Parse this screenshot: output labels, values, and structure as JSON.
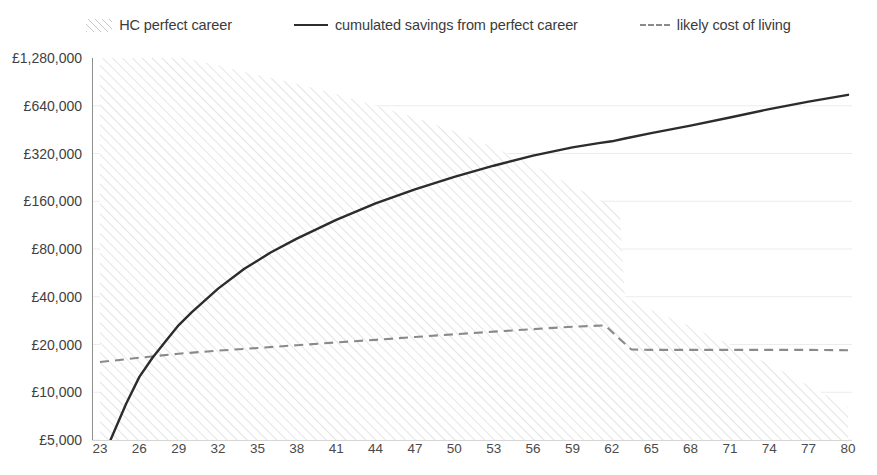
{
  "legend": {
    "items": [
      {
        "label": "HC perfect career",
        "marker": "hatch-swatch-icon"
      },
      {
        "label": "cumulated savings from perfect career",
        "marker": "solid-line-icon"
      },
      {
        "label": "likely cost of living",
        "marker": "dashed-line-icon"
      }
    ]
  },
  "chart_data": {
    "type": "line",
    "title": "",
    "xlabel": "",
    "ylabel": "",
    "yscale": "log2",
    "ylim": [
      5000,
      1280000
    ],
    "xlim": [
      23,
      80
    ],
    "grid": true,
    "legend_position": "top",
    "currency": "£",
    "y_ticks": [
      1280000,
      640000,
      320000,
      160000,
      80000,
      40000,
      20000,
      10000,
      5000
    ],
    "y_tick_labels": [
      "£1,280,000",
      "£640,000",
      "£320,000",
      "£160,000",
      "£80,000",
      "£40,000",
      "£20,000",
      "£10,000",
      "£5,000"
    ],
    "x_ticks": [
      23,
      26,
      29,
      32,
      35,
      38,
      41,
      44,
      47,
      50,
      53,
      56,
      59,
      62,
      65,
      68,
      71,
      74,
      77,
      80
    ],
    "x_tick_labels": [
      "23",
      "26",
      "29",
      "32",
      "35",
      "38",
      "41",
      "44",
      "47",
      "50",
      "53",
      "56",
      "59",
      "62",
      "65",
      "68",
      "71",
      "74",
      "77",
      "80"
    ],
    "series": [
      {
        "name": "HC perfect career",
        "type": "area",
        "style": "hatched",
        "color": "#c9c9c9",
        "x": [
          23,
          26,
          29,
          32,
          35,
          38,
          41,
          44,
          47,
          50,
          53,
          56,
          59,
          62,
          62.6,
          63,
          65,
          68,
          71,
          74,
          77,
          80
        ],
        "y": [
          1600000,
          1450000,
          1300000,
          1150000,
          1000000,
          880000,
          760000,
          640000,
          540000,
          440000,
          350000,
          270000,
          200000,
          150000,
          140000,
          40000,
          33000,
          26000,
          20000,
          15000,
          11000,
          8000
        ]
      },
      {
        "name": "cumulated savings from perfect career",
        "type": "line",
        "style": "solid",
        "color": "#2c2c2c",
        "x": [
          23.8,
          25,
          26,
          27,
          28,
          29,
          30,
          32,
          34,
          36,
          38,
          41,
          44,
          47,
          50,
          53,
          56,
          59,
          61,
          62,
          63,
          65,
          68,
          71,
          74,
          77,
          80
        ],
        "y": [
          5000,
          8500,
          12500,
          16500,
          21000,
          26500,
          32000,
          45000,
          60000,
          76000,
          93000,
          122000,
          155000,
          190000,
          228000,
          268000,
          310000,
          350000,
          372000,
          382000,
          398000,
          430000,
          480000,
          540000,
          610000,
          680000,
          750000
        ]
      },
      {
        "name": "likely cost of living",
        "type": "line",
        "style": "dashed",
        "color": "#8a8a8a",
        "x": [
          23,
          26,
          29,
          32,
          35,
          38,
          41,
          44,
          47,
          50,
          53,
          56,
          59,
          61.5,
          62.5,
          63.5,
          65,
          68,
          71,
          74,
          77,
          80
        ],
        "y": [
          15500,
          16500,
          17500,
          18300,
          19000,
          19800,
          20600,
          21400,
          22300,
          23200,
          24100,
          25000,
          25900,
          26400,
          22000,
          18600,
          18500,
          18500,
          18500,
          18500,
          18500,
          18400
        ]
      }
    ]
  }
}
